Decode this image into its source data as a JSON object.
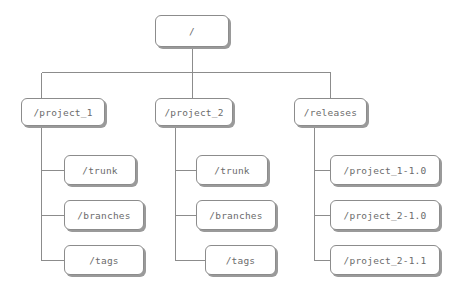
{
  "diagram": {
    "type": "tree",
    "style": {
      "node_fill": "#ffffff",
      "node_border": "#8c8c8c",
      "node_shadow": "#9a9a9a",
      "text_color": "#6b6b6b",
      "line_color": "#8c8c8c",
      "background": "#ffffff"
    },
    "nodes": [
      {
        "id": "root",
        "label": "/",
        "x": 155,
        "y": 15,
        "w": 74,
        "h": 32
      },
      {
        "id": "project_1",
        "label": "/project_1",
        "x": 21,
        "y": 98,
        "w": 84,
        "h": 28
      },
      {
        "id": "project_2",
        "label": "/project_2",
        "x": 155,
        "y": 98,
        "w": 78,
        "h": 28
      },
      {
        "id": "releases",
        "label": "/releases",
        "x": 294,
        "y": 98,
        "w": 73,
        "h": 28
      },
      {
        "id": "p1_trunk",
        "label": "/trunk",
        "x": 64,
        "y": 155,
        "w": 72,
        "h": 30
      },
      {
        "id": "p1_branches",
        "label": "/branches",
        "x": 64,
        "y": 200,
        "w": 80,
        "h": 30
      },
      {
        "id": "p1_tags",
        "label": "/tags",
        "x": 64,
        "y": 245,
        "w": 80,
        "h": 30
      },
      {
        "id": "p2_trunk",
        "label": "/trunk",
        "x": 196,
        "y": 155,
        "w": 72,
        "h": 30
      },
      {
        "id": "p2_branches",
        "label": "/branches",
        "x": 196,
        "y": 200,
        "w": 80,
        "h": 30
      },
      {
        "id": "p2_tags",
        "label": "/tags",
        "x": 205,
        "y": 245,
        "w": 71,
        "h": 30
      },
      {
        "id": "rel_1",
        "label": "/project_1-1.0",
        "x": 330,
        "y": 155,
        "w": 110,
        "h": 30
      },
      {
        "id": "rel_2",
        "label": "/project_2-1.0",
        "x": 330,
        "y": 200,
        "w": 110,
        "h": 30
      },
      {
        "id": "rel_3",
        "label": "/project_2-1.1",
        "x": 330,
        "y": 245,
        "w": 110,
        "h": 30
      }
    ],
    "edges": [
      {
        "from": "root",
        "to": "project_1",
        "kind": "bus"
      },
      {
        "from": "root",
        "to": "project_2",
        "kind": "bus"
      },
      {
        "from": "root",
        "to": "releases",
        "kind": "bus"
      },
      {
        "from": "project_1",
        "to": "p1_trunk",
        "kind": "elbow"
      },
      {
        "from": "project_1",
        "to": "p1_branches",
        "kind": "elbow"
      },
      {
        "from": "project_1",
        "to": "p1_tags",
        "kind": "elbow"
      },
      {
        "from": "project_2",
        "to": "p2_trunk",
        "kind": "elbow"
      },
      {
        "from": "project_2",
        "to": "p2_branches",
        "kind": "elbow"
      },
      {
        "from": "project_2",
        "to": "p2_tags",
        "kind": "elbow"
      },
      {
        "from": "releases",
        "to": "rel_1",
        "kind": "elbow"
      },
      {
        "from": "releases",
        "to": "rel_2",
        "kind": "elbow"
      },
      {
        "from": "releases",
        "to": "rel_3",
        "kind": "elbow"
      }
    ],
    "geometry": {
      "root_stem_x": 192,
      "bus_y": 72,
      "bus_left_x": 41,
      "bus_right_x": 330,
      "spine_p1_x": 41,
      "spine_p2_x": 175,
      "spine_rel_x": 314,
      "child_row_mid_y": [
        170,
        215,
        260
      ]
    }
  }
}
